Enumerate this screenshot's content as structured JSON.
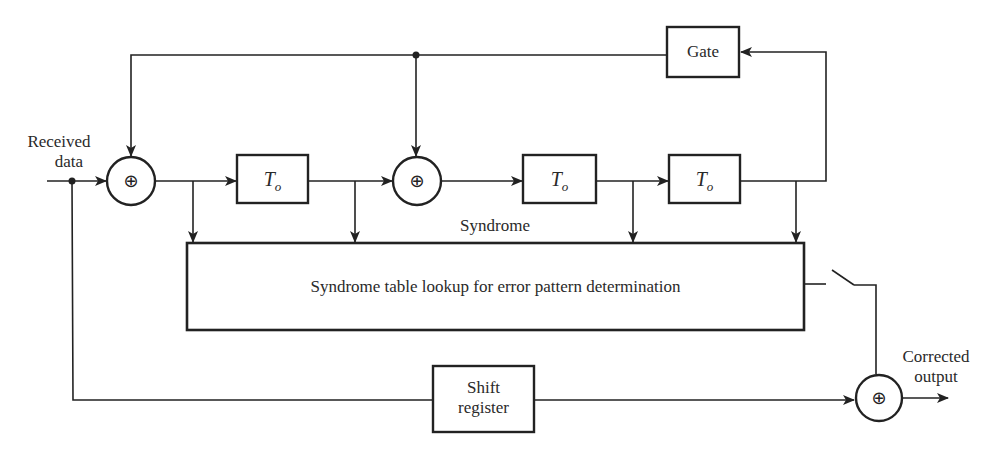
{
  "diagram": {
    "labels": {
      "input_line1": "Received",
      "input_line2": "data",
      "output_line1": "Corrected",
      "output_line2": "output",
      "syndrome": "Syndrome",
      "lookup_box": "Syndrome table lookup for error pattern determination",
      "gate_box": "Gate",
      "shift_register_line1": "Shift",
      "shift_register_line2": "register",
      "delay_symbol": "T",
      "delay_subscript": "o",
      "adder_symbol": "⊕"
    },
    "nodes": [
      {
        "id": "adder-1",
        "type": "modulo-2 adder",
        "symbol": "⊕"
      },
      {
        "id": "delay-1",
        "type": "delay element",
        "label": "T_o"
      },
      {
        "id": "adder-2",
        "type": "modulo-2 adder",
        "symbol": "⊕"
      },
      {
        "id": "delay-2",
        "type": "delay element",
        "label": "T_o"
      },
      {
        "id": "delay-3",
        "type": "delay element",
        "label": "T_o"
      },
      {
        "id": "gate",
        "type": "gate",
        "label": "Gate"
      },
      {
        "id": "lookup",
        "type": "table lookup",
        "label": "Syndrome table lookup for error pattern determination"
      },
      {
        "id": "switch",
        "type": "switch"
      },
      {
        "id": "shift-register",
        "type": "register",
        "label": "Shift register"
      },
      {
        "id": "adder-3",
        "type": "modulo-2 adder",
        "symbol": "⊕"
      }
    ],
    "edges": [
      {
        "from": "input",
        "to": "adder-1"
      },
      {
        "from": "adder-1",
        "to": "delay-1"
      },
      {
        "from": "delay-1",
        "to": "adder-2"
      },
      {
        "from": "adder-2",
        "to": "delay-2"
      },
      {
        "from": "delay-2",
        "to": "delay-3"
      },
      {
        "from": "delay-3",
        "to": "gate"
      },
      {
        "from": "gate",
        "to": "adder-1"
      },
      {
        "from": "gate",
        "to": "adder-2"
      },
      {
        "from": "adder-1",
        "to": "lookup"
      },
      {
        "from": "delay-1",
        "to": "lookup"
      },
      {
        "from": "delay-2",
        "to": "lookup"
      },
      {
        "from": "delay-3",
        "to": "lookup"
      },
      {
        "from": "lookup",
        "to": "switch"
      },
      {
        "from": "switch",
        "to": "adder-3"
      },
      {
        "from": "input",
        "to": "shift-register"
      },
      {
        "from": "shift-register",
        "to": "adder-3"
      },
      {
        "from": "adder-3",
        "to": "output"
      }
    ],
    "colors": {
      "stroke": "#222222",
      "text": "#2a2a2a",
      "background": "#ffffff"
    }
  }
}
